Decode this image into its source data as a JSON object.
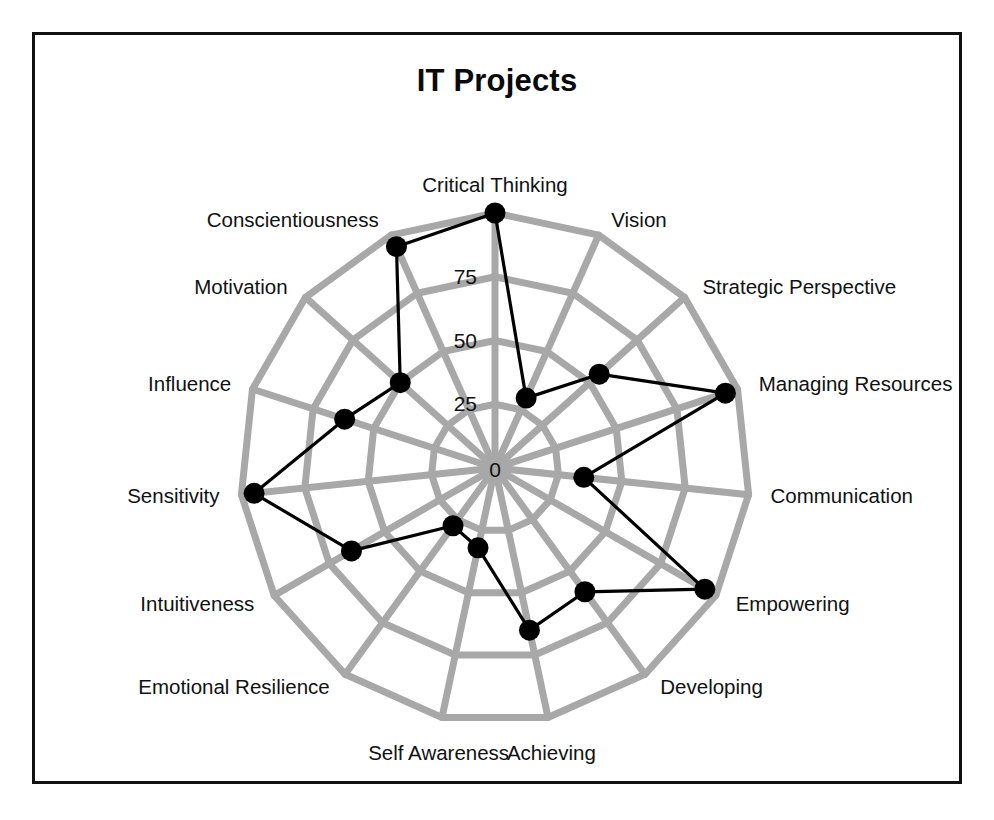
{
  "chart": {
    "title": "IT Projects",
    "frame_border_color": "#111111",
    "background_color": "#ffffff"
  },
  "chart_data": {
    "type": "radar",
    "title": "IT Projects",
    "xlabel": "",
    "ylabel": "",
    "grid": true,
    "legend": "none",
    "grid_color": "#a8a8a8",
    "series_color": "#000000",
    "marker_color": "#000000",
    "rlim": [
      0,
      100
    ],
    "tick_labels": [
      "0",
      "25",
      "50",
      "75"
    ],
    "tick_values": [
      0,
      25,
      50,
      75
    ],
    "ring_values": [
      25,
      50,
      75,
      100
    ],
    "categories": [
      "Critical Thinking",
      "Vision",
      "Strategic Perspective",
      "Managing Resources",
      "Communication",
      "Empowering",
      "Developing",
      "Achieving",
      "Self Awareness",
      "Emotional Resilience",
      "Intuitiveness",
      "Sensitivity",
      "Influence",
      "Motivation",
      "Conscientiousness"
    ],
    "series": [
      {
        "name": "IT Projects",
        "values": [
          100,
          30,
          55,
          95,
          35,
          95,
          60,
          65,
          32,
          28,
          65,
          95,
          62,
          50,
          95
        ]
      }
    ]
  },
  "axis_label_anchors": [
    "middle",
    "start",
    "start",
    "start",
    "start",
    "start",
    "start",
    "middle",
    "middle",
    "end",
    "end",
    "end",
    "end",
    "end",
    "end"
  ]
}
